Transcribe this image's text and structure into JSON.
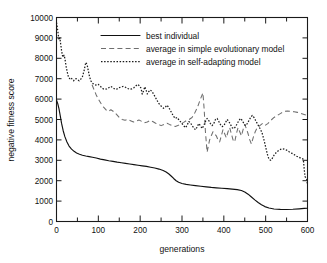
{
  "chart_data": {
    "type": "line",
    "title": "",
    "xlabel": "generations",
    "ylabel": "negative fitness score",
    "xlim": [
      0,
      600
    ],
    "ylim": [
      0,
      10000
    ],
    "xticks": [
      0,
      100,
      200,
      300,
      400,
      500,
      600
    ],
    "xticklabels": [
      "0",
      "100",
      "200",
      "300",
      "400",
      "500",
      "600"
    ],
    "xminor_step": 50,
    "yticks": [
      0,
      1000,
      2000,
      3000,
      4000,
      5000,
      6000,
      7000,
      8000,
      9000,
      10000
    ],
    "yticklabels": [
      "0",
      "1000",
      "2000",
      "3000",
      "4000",
      "5000",
      "6000",
      "7000",
      "8000",
      "9000",
      "10000"
    ],
    "grid": false,
    "legend_position": "upper-center",
    "series": [
      {
        "name": "best individual",
        "style": "solid",
        "color": "#111111",
        "x": [
          0,
          3,
          6,
          9,
          12,
          16,
          20,
          25,
          30,
          36,
          42,
          48,
          55,
          62,
          70,
          78,
          86,
          95,
          105,
          115,
          125,
          135,
          145,
          155,
          165,
          175,
          185,
          195,
          205,
          215,
          225,
          235,
          245,
          255,
          262,
          268,
          274,
          280,
          286,
          292,
          300,
          310,
          320,
          332,
          345,
          358,
          370,
          382,
          395,
          408,
          420,
          432,
          442,
          450,
          458,
          466,
          474,
          482,
          490,
          498,
          508,
          520,
          535,
          550,
          565,
          580,
          592,
          600
        ],
        "y": [
          5950,
          5780,
          5520,
          5180,
          4820,
          4450,
          4160,
          3900,
          3700,
          3550,
          3440,
          3360,
          3300,
          3250,
          3210,
          3180,
          3150,
          3110,
          3060,
          3020,
          2980,
          2945,
          2910,
          2880,
          2850,
          2820,
          2790,
          2760,
          2730,
          2700,
          2660,
          2620,
          2570,
          2500,
          2430,
          2340,
          2230,
          2110,
          2000,
          1920,
          1860,
          1820,
          1790,
          1760,
          1730,
          1700,
          1670,
          1650,
          1630,
          1610,
          1590,
          1560,
          1520,
          1450,
          1340,
          1200,
          1060,
          930,
          820,
          730,
          660,
          615,
          595,
          590,
          600,
          620,
          640,
          650
        ]
      },
      {
        "name": "average in simple evolutionary model",
        "style": "dashed",
        "color": "#6e6e6e",
        "x": [
          85,
          90,
          95,
          100,
          106,
          112,
          118,
          124,
          130,
          137,
          144,
          150,
          157,
          164,
          170,
          177,
          184,
          190,
          197,
          204,
          210,
          217,
          224,
          230,
          237,
          244,
          250,
          257,
          264,
          270,
          277,
          284,
          290,
          297,
          304,
          310,
          317,
          324,
          330,
          337,
          344,
          350,
          353,
          356,
          358,
          360,
          363,
          366,
          370,
          374,
          378,
          382,
          386,
          390,
          394,
          398,
          402,
          406,
          410,
          414,
          418,
          422,
          426,
          430,
          434,
          438,
          442,
          446,
          450,
          454,
          458,
          462,
          466,
          470,
          475,
          480,
          486,
          492,
          498,
          505,
          512,
          520,
          528,
          536,
          544,
          552,
          560,
          568,
          576,
          584,
          592,
          600
        ],
        "y": [
          6700,
          6450,
          6200,
          6000,
          5800,
          5620,
          5480,
          5400,
          5480,
          5380,
          5240,
          5100,
          5000,
          4960,
          5000,
          4940,
          4880,
          4920,
          4980,
          4900,
          4840,
          4880,
          4960,
          4900,
          4820,
          4760,
          4700,
          4760,
          4820,
          4760,
          4700,
          4660,
          4700,
          4780,
          4860,
          4940,
          5000,
          5100,
          5300,
          5600,
          6000,
          6300,
          5500,
          4400,
          3900,
          3400,
          3700,
          4000,
          4200,
          4400,
          4300,
          4200,
          4000,
          3900,
          4200,
          4500,
          4300,
          4100,
          4400,
          4600,
          4300,
          4000,
          3900,
          4300,
          4600,
          4400,
          4200,
          4500,
          4750,
          4550,
          4300,
          4000,
          3800,
          4100,
          4400,
          4600,
          4700,
          4800,
          4700,
          4800,
          4950,
          5100,
          5200,
          5300,
          5400,
          5420,
          5400,
          5380,
          5350,
          5300,
          5250,
          5200
        ]
      },
      {
        "name": "average in self-adapting model",
        "style": "dotted",
        "color": "#1a1a1a",
        "x": [
          0,
          2,
          4,
          6,
          8,
          10,
          12,
          14,
          16,
          18,
          20,
          23,
          26,
          29,
          32,
          35,
          38,
          41,
          44,
          47,
          50,
          54,
          58,
          62,
          66,
          70,
          73,
          76,
          79,
          82,
          85,
          88,
          92,
          96,
          100,
          104,
          108,
          112,
          116,
          120,
          125,
          130,
          135,
          140,
          145,
          150,
          155,
          160,
          165,
          170,
          175,
          180,
          185,
          190,
          194,
          198,
          202,
          205,
          208,
          211,
          214,
          217,
          220,
          224,
          228,
          232,
          236,
          240,
          244,
          248,
          252,
          256,
          260,
          264,
          268,
          272,
          276,
          280,
          284,
          288,
          292,
          296,
          300,
          304,
          308,
          312,
          316,
          320,
          324,
          328,
          332,
          336,
          340,
          344,
          348,
          352,
          356,
          360,
          364,
          368,
          372,
          376,
          380,
          384,
          388,
          392,
          396,
          400,
          404,
          408,
          412,
          416,
          420,
          424,
          428,
          432,
          436,
          440,
          444,
          448,
          452,
          456,
          460,
          464,
          468,
          472,
          476,
          480,
          484,
          488,
          492,
          496,
          500,
          504,
          508,
          512,
          516,
          520,
          526,
          532,
          538,
          544,
          550,
          556,
          562,
          568,
          574,
          580,
          584,
          588,
          590,
          592,
          594,
          596,
          598,
          600
        ],
        "y": [
          9750,
          9500,
          9200,
          8900,
          9000,
          8700,
          8400,
          8150,
          8050,
          8150,
          8000,
          7600,
          7300,
          7050,
          7000,
          7050,
          6950,
          6900,
          6980,
          7000,
          6950,
          6900,
          6980,
          7100,
          7400,
          7800,
          7700,
          7400,
          7100,
          6900,
          6800,
          6750,
          6700,
          6680,
          6720,
          6650,
          6560,
          6500,
          6480,
          6500,
          6560,
          6620,
          6560,
          6480,
          6500,
          6560,
          6600,
          6620,
          6580,
          6520,
          6480,
          6500,
          6560,
          6650,
          6720,
          6660,
          6540,
          6250,
          6400,
          6600,
          6450,
          6250,
          6350,
          6450,
          6380,
          6250,
          6100,
          5950,
          5800,
          5700,
          5620,
          5550,
          5600,
          5700,
          5600,
          5450,
          5300,
          5150,
          5050,
          5100,
          5000,
          4900,
          4800,
          4700,
          4600,
          4700,
          4900,
          4850,
          4700,
          4600,
          4500,
          4620,
          4800,
          4700,
          4560,
          4700,
          4900,
          5050,
          4950,
          4800,
          4700,
          4800,
          5000,
          5050,
          4900,
          4750,
          4650,
          4700,
          4850,
          5000,
          4900,
          4750,
          4600,
          4550,
          4650,
          4800,
          4950,
          5050,
          4950,
          4800,
          4700,
          4800,
          4950,
          5100,
          5200,
          5100,
          4950,
          4800,
          4650,
          4500,
          4300,
          4000,
          3650,
          3300,
          3050,
          3000,
          3100,
          3250,
          3400,
          3500,
          3560,
          3550,
          3500,
          3420,
          3350,
          3280,
          3200,
          3150,
          3100,
          3080,
          3050,
          2600,
          2200,
          2150,
          2100,
          1800
        ]
      }
    ],
    "legend": [
      {
        "label": "best individual",
        "style": "solid"
      },
      {
        "label": "average in simple evolutionary model",
        "style": "dashed"
      },
      {
        "label": "average in self-adapting model",
        "style": "dotted"
      }
    ]
  }
}
